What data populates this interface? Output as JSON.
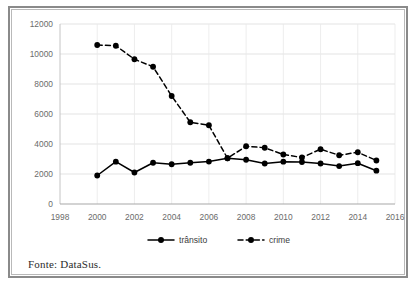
{
  "figure": {
    "source_note": "Fonte: DataSus.",
    "frame_color": "#8a8a8a",
    "background_color": "#ffffff"
  },
  "chart_data": {
    "type": "line",
    "title": "",
    "subtitle": "",
    "xlabel": "",
    "ylabel": "",
    "x": [
      2000,
      2001,
      2002,
      2003,
      2004,
      2005,
      2006,
      2007,
      2008,
      2009,
      2010,
      2011,
      2012,
      2013,
      2014,
      2015
    ],
    "xlim": [
      1998,
      2016
    ],
    "ylim": [
      0,
      12000
    ],
    "xticks": [
      1998,
      2000,
      2002,
      2004,
      2006,
      2008,
      2010,
      2012,
      2014,
      2016
    ],
    "xtick_labels": [
      "1998",
      "2000",
      "2002",
      "2004",
      "2006",
      "2008",
      "2010",
      "2012",
      "2014",
      "2016"
    ],
    "yticks": [
      0,
      2000,
      4000,
      6000,
      8000,
      10000,
      12000
    ],
    "ytick_labels": [
      "0",
      "2000",
      "4000",
      "6000",
      "8000",
      "10000",
      "12000"
    ],
    "grid": true,
    "grid_axis": "y",
    "legend_position": "bottom",
    "series": [
      {
        "name": "trânsito",
        "style": "solid",
        "marker": "circle",
        "color": "#000000",
        "values": [
          1900,
          2820,
          2100,
          2750,
          2650,
          2750,
          2830,
          3050,
          2950,
          2700,
          2820,
          2800,
          2700,
          2530,
          2720,
          2220
        ]
      },
      {
        "name": "crime",
        "style": "dashed",
        "marker": "circle",
        "color": "#000000",
        "values": [
          10600,
          10550,
          9650,
          9150,
          7200,
          5450,
          5250,
          3050,
          3850,
          3750,
          3300,
          3100,
          3650,
          3250,
          3450,
          2900
        ]
      }
    ]
  }
}
